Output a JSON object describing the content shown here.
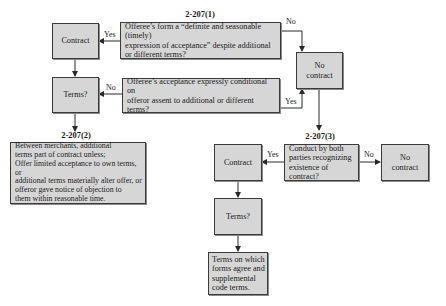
{
  "diagram": {
    "type": "flowchart",
    "sections": {
      "s1": "2-207(1)",
      "s2": "2-207(2)",
      "s3": "2-207(3)"
    },
    "nodes": {
      "contract_top": "Contract",
      "decision_definite": "Offeree’s form a “definite and seasonable (timely)\nexpression of acceptance” despite additional\nor different terms?",
      "no_contract_top": "No\ncontract",
      "terms_top": "Terms?",
      "decision_conditional": "Offeree’s acceptance expressly conditional on\nofferor assent to additional or different terms?",
      "merchants_rule": "Between merchants, additional\nterms part of contract unless;\nOffer limited acceptance to own terms, or\nadditional terms materially alter offer, or\nofferor gave notice of objection to\nthem within reasonable time.",
      "contract_bottom": "Contract",
      "decision_conduct": "Conduct by both\nparties recognizing\nexistence of contract?",
      "no_contract_bottom": "No\ncontract",
      "terms_bottom": "Terms?",
      "final_terms": "Terms on which\nforms agree and\nsupplemental\ncode terms."
    },
    "edge_labels": {
      "definite_yes": "Yes",
      "definite_no": "No",
      "conditional_no": "No",
      "conditional_yes": "Yes",
      "conduct_yes": "Yes",
      "conduct_no": "No"
    },
    "colors": {
      "box_fill": "#d6d6d6",
      "box_border": "#3a3a3a",
      "line": "#2a2a2a"
    }
  }
}
